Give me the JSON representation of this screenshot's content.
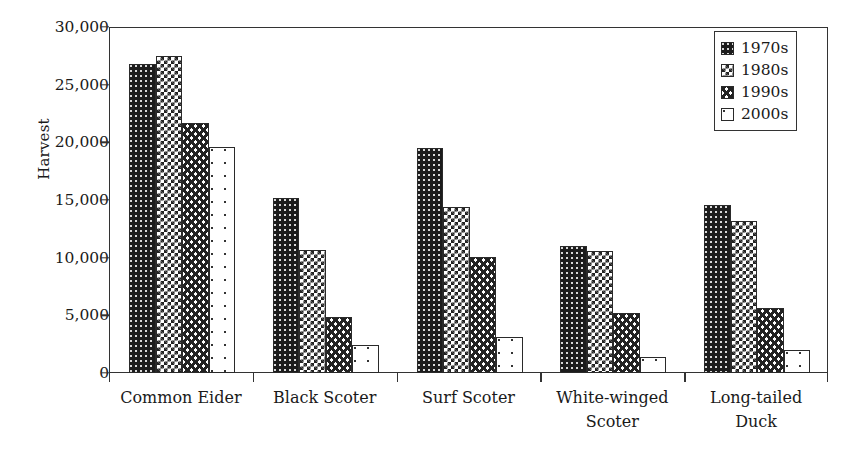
{
  "chart_data": {
    "type": "bar",
    "title": "",
    "xlabel": "",
    "ylabel": "Harvest",
    "ylim": [
      0,
      30000
    ],
    "yticks": [
      0,
      5000,
      10000,
      15000,
      20000,
      25000,
      30000
    ],
    "ytick_labels": [
      "0",
      "5,000",
      "10,000",
      "15,000",
      "20,000",
      "25,000",
      "30,000"
    ],
    "grid": false,
    "legend_position": "top-right",
    "categories": [
      "Common Eider",
      "Black Scoter",
      "Surf Scoter",
      "White-winged\nScoter",
      "Long-tailed\nDuck"
    ],
    "series": [
      {
        "name": "1970s",
        "pattern": "dense-dark-dots",
        "values": [
          26800,
          15200,
          19500,
          11000,
          14600
        ]
      },
      {
        "name": "1980s",
        "pattern": "checkerboard",
        "values": [
          27500,
          10700,
          14400,
          10600,
          13200
        ]
      },
      {
        "name": "1990s",
        "pattern": "wavy-lines",
        "values": [
          21700,
          4900,
          10100,
          5200,
          5600
        ]
      },
      {
        "name": "2000s",
        "pattern": "sparse-dots",
        "values": [
          19600,
          2400,
          3100,
          1400,
          2000
        ]
      }
    ]
  },
  "legend": {
    "items": [
      {
        "label": "1970s",
        "pattern": "dense-dark-dots"
      },
      {
        "label": "1980s",
        "pattern": "checkerboard"
      },
      {
        "label": "1990s",
        "pattern": "wavy-lines"
      },
      {
        "label": "2000s",
        "pattern": "sparse-dots"
      }
    ]
  },
  "colors": {
    "axis": "#333333",
    "bar_outline": "#2a2a2a",
    "dark_fill": "#1c1c1c",
    "background": "#ffffff"
  }
}
